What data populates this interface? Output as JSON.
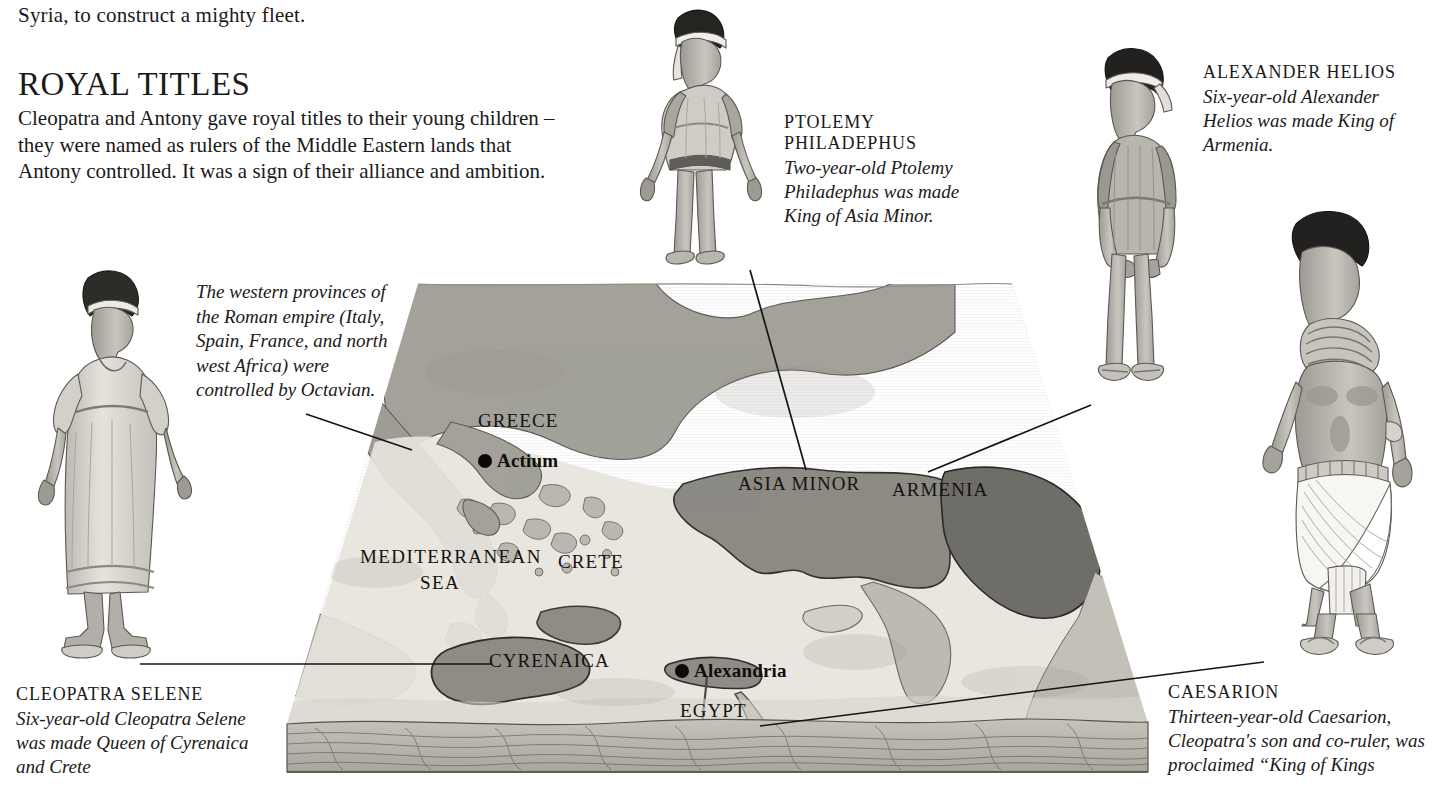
{
  "page": {
    "lead_in": "Syria, to construct a mighty fleet.",
    "section_title": "Royal Titles",
    "section_body": "Cleopatra and Antony gave royal titles to their young children – they were named as rulers of the Middle Eastern lands that Antony controlled. It was a sign of their alliance and ambition."
  },
  "notes": {
    "octavian_note": "The western provinces of the Roman empire (Italy, Spain, France, and north west Africa) were controlled by Octavian."
  },
  "captions": {
    "ptolemy": {
      "heading_line1": "Ptolemy",
      "heading_line2": "Philadephus",
      "body": "Two-year-old Ptolemy Philadephus was made King of Asia Minor."
    },
    "alexander": {
      "heading": "Alexander Helios",
      "body": "Six-year-old Alexander Helios was made King of Armenia."
    },
    "cleopatra_selene": {
      "heading": "Cleopatra Selene",
      "body": "Six-year-old Cleopatra Selene was made Queen of Cyrenaica and Crete"
    },
    "caesarion": {
      "heading": "Caesarion",
      "body": "Thirteen-year-old Caesarion, Cleopatra's son and co-ruler, was proclaimed “King of Kings"
    }
  },
  "map": {
    "regions": [
      {
        "name": "Greece",
        "label": "Greece"
      },
      {
        "name": "Asia Minor",
        "label": "Asia Minor"
      },
      {
        "name": "Armenia",
        "label": "Armenia"
      },
      {
        "name": "Crete",
        "label": "Crete"
      },
      {
        "name": "Cyrenaica",
        "label": "Cyrenaica"
      },
      {
        "name": "Egypt",
        "label": "Egypt"
      }
    ],
    "sea_label_line1": "Mediterranean",
    "sea_label_line2": "Sea",
    "cities": [
      {
        "name": "Actium",
        "label": "Actium"
      },
      {
        "name": "Alexandria",
        "label": "Alexandria"
      }
    ]
  },
  "figures": [
    {
      "id": "cleopatra-selene",
      "name": "Cleopatra Selene figure"
    },
    {
      "id": "ptolemy-philadephus",
      "name": "Ptolemy Philadephus figure"
    },
    {
      "id": "alexander-helios",
      "name": "Alexander Helios figure"
    },
    {
      "id": "caesarion",
      "name": "Caesarion figure"
    }
  ],
  "colors": {
    "ink": "#1a1a1a",
    "sea": "#d9d6cf",
    "land_light": "#e4e1da",
    "land_mid": "#a9a79f",
    "highlight_mid": "#8e8c85",
    "highlight_dark": "#76746e",
    "slab_side": "#b4b1a9",
    "outline": "#4a4843"
  }
}
